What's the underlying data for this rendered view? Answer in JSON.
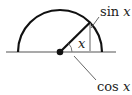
{
  "diagram": {
    "labels": {
      "sin": "sin",
      "cos": "cos",
      "var": "x",
      "angle": "x"
    },
    "colors": {
      "circle": "#111111",
      "radius": "#111111",
      "baseline": "#555555",
      "projection": "#a0a0a0",
      "leader": "#555555"
    }
  }
}
